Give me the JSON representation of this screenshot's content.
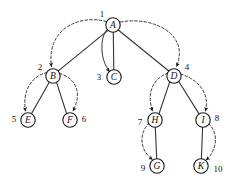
{
  "diagram": {
    "type": "tree-traversal-diagram",
    "canvas": {
      "width": 237,
      "height": 183,
      "background": "#ffffff"
    },
    "colors": {
      "node_fill": "#ffffff",
      "node_stroke": "#1a1a1a",
      "tree_edge": "#333333",
      "traversal_edge": "#222222",
      "label_text": "#111111"
    },
    "nodes": [
      {
        "id": "A",
        "letter": "A",
        "order": "1",
        "cx": 113,
        "cy": 25,
        "r": 7.2,
        "label_dx": -11,
        "label_dy": -11
      },
      {
        "id": "B",
        "letter": "B",
        "order": "2",
        "cx": 53,
        "cy": 76,
        "r": 7.2,
        "label_dx": -13,
        "label_dy": -9
      },
      {
        "id": "C",
        "letter": "C",
        "order": "3",
        "cx": 114,
        "cy": 77,
        "r": 7.2,
        "label_dx": -15,
        "label_dy": 0
      },
      {
        "id": "D",
        "letter": "D",
        "order": "4",
        "cx": 174,
        "cy": 76,
        "r": 7.2,
        "label_dx": 13,
        "label_dy": -9
      },
      {
        "id": "E",
        "letter": "E",
        "order": "5",
        "cx": 28,
        "cy": 120,
        "r": 7.2,
        "label_dx": -14,
        "label_dy": -1
      },
      {
        "id": "F",
        "letter": "F",
        "order": "6",
        "cx": 70,
        "cy": 120,
        "r": 7.2,
        "label_dx": 14,
        "label_dy": -1
      },
      {
        "id": "H",
        "letter": "H",
        "order": "7",
        "cx": 155,
        "cy": 120,
        "r": 7.2,
        "label_dx": -15,
        "label_dy": 2
      },
      {
        "id": "I",
        "letter": "I",
        "order": "8",
        "cx": 203,
        "cy": 120,
        "r": 7.2,
        "label_dx": 14,
        "label_dy": -2
      },
      {
        "id": "G",
        "letter": "G",
        "order": "9",
        "cx": 157,
        "cy": 166,
        "r": 7.2,
        "label_dx": -14,
        "label_dy": 2
      },
      {
        "id": "K",
        "letter": "K",
        "order": "10",
        "cx": 201,
        "cy": 166,
        "r": 7.2,
        "label_dx": 17,
        "label_dy": 3
      }
    ],
    "tree_edges": [
      {
        "from": "A",
        "to": "B",
        "path": "M 108.0 30.4 L 58.3 70.9"
      },
      {
        "from": "A",
        "to": "C",
        "path": "M 113.3 32.2 L 113.8 69.8"
      },
      {
        "from": "A",
        "to": "D",
        "path": "M 118.3 30.0 L 168.8 71.0"
      },
      {
        "from": "B",
        "to": "E",
        "path": "M 49.4 82.1 L 31.6 113.6"
      },
      {
        "from": "B",
        "to": "F",
        "path": "M 56.5 82.1 L 66.6 113.6"
      },
      {
        "from": "D",
        "to": "H",
        "path": "M 170.0 81.1 L 159.1 113.5"
      },
      {
        "from": "D",
        "to": "I",
        "path": "M 178.6 81.3 L 198.9 113.6"
      },
      {
        "from": "H",
        "to": "G",
        "path": "M 155.3 127.2 L 156.7 158.8"
      },
      {
        "from": "I",
        "to": "K",
        "path": "M 202.6 127.2 L 201.4 158.8"
      }
    ],
    "traversal_edges": [
      {
        "from": "A",
        "to": "B",
        "style": "dashed",
        "path": "M 106.3 21.5 C 78 14, 46 30, 51.5 66.5"
      },
      {
        "from": "A",
        "to": "C",
        "style": "solid",
        "path": "M 108.0 28.5 C 99 37, 100 60, 109.5 71.5"
      },
      {
        "from": "A",
        "to": "D",
        "style": "dashed",
        "path": "M 120.5 22.0 C 153 16, 190 34, 176.5 66.5"
      },
      {
        "from": "B",
        "to": "E",
        "style": "dashed",
        "path": "M 47.0 72.5 C 32 76, 22 90, 25.5 111.0"
      },
      {
        "from": "B",
        "to": "F",
        "style": "dashed",
        "path": "M 59.5 73.5 C 75 78, 83 92, 73.0 111.0"
      },
      {
        "from": "D",
        "to": "H",
        "style": "dashed",
        "path": "M 168.0 73.0 C 154 78, 146 92, 152.5 111.0"
      },
      {
        "from": "D",
        "to": "I",
        "style": "dashed",
        "path": "M 180.5 74.0 C 197 79, 210 92, 205.5 111.0"
      },
      {
        "from": "H",
        "to": "G",
        "style": "dashed",
        "path": "M 149.5 123.0 C 139 132, 139 150, 152.5 159.5"
      },
      {
        "from": "I",
        "to": "K",
        "style": "dashed",
        "path": "M 208.5 123.5 C 219 133, 217 151, 206.0 160.0"
      }
    ],
    "visit_order": [
      "A",
      "B",
      "E",
      "F",
      "C",
      "D",
      "H",
      "G",
      "I",
      "K"
    ]
  }
}
